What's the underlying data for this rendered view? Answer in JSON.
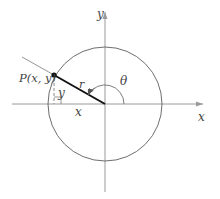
{
  "diagram": {
    "title": "",
    "colors": {
      "axis": "#9a9a9a",
      "circle": "#6e6e6e",
      "radius": "#111111",
      "terminal_ray": "#8a8a8a",
      "label": "#444444",
      "dashed": "#8a8a8a"
    },
    "labels": {
      "x_axis": "x",
      "y_axis": "y",
      "point": "P(x, y)",
      "radius": "r",
      "angle": "θ",
      "horizontal_leg": "x",
      "vertical_leg": "y"
    }
  }
}
